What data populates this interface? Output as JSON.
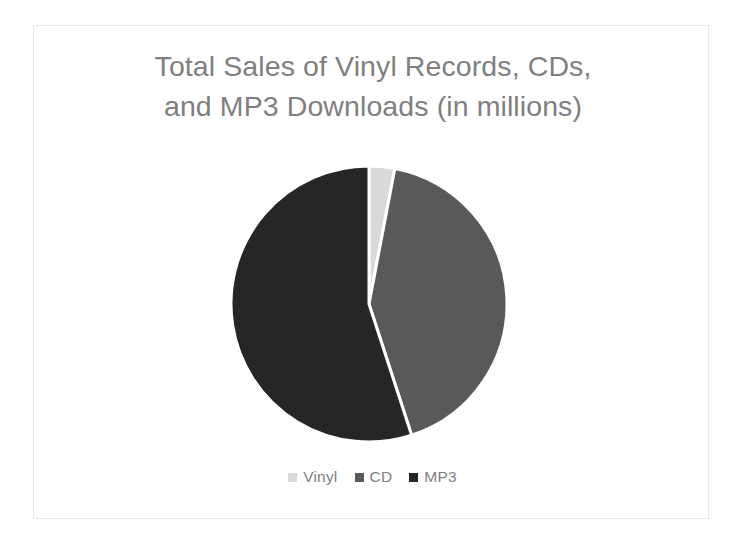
{
  "chart_data": {
    "type": "pie",
    "title": "Total Sales of Vinyl Records, CDs,\nand MP3 Downloads (in millions)",
    "title_line1": "Total Sales of Vinyl Records, CDs,",
    "title_line2": "and MP3 Downloads (in millions)",
    "xlabel": "",
    "ylabel": "",
    "grid": false,
    "legend_position": "bottom",
    "start_angle_deg": 0,
    "direction": "clockwise",
    "units": "millions",
    "categories": [
      "Vinyl",
      "CD",
      "MP3"
    ],
    "values": [
      3,
      42,
      55
    ],
    "percentages": [
      3,
      42,
      55
    ],
    "colors": [
      "#d9d9d9",
      "#595959",
      "#262626"
    ],
    "slices": [
      {
        "label": "Vinyl",
        "value": 3,
        "percent": 3,
        "color": "#d9d9d9",
        "start_deg": 0,
        "end_deg": 10.8
      },
      {
        "label": "CD",
        "value": 42,
        "percent": 42,
        "color": "#595959",
        "start_deg": 10.8,
        "end_deg": 162
      },
      {
        "label": "MP3",
        "value": 55,
        "percent": 55,
        "color": "#262626",
        "start_deg": 162,
        "end_deg": 360
      }
    ],
    "legend": [
      {
        "label": "Vinyl",
        "color": "#d9d9d9"
      },
      {
        "label": "CD",
        "color": "#595959"
      },
      {
        "label": "MP3",
        "color": "#262626"
      }
    ]
  },
  "style": {
    "title_color": "#7f7f7f",
    "legend_text_color": "#7f7f7f",
    "background": "#ffffff",
    "frame_border": "#e8e8e8",
    "slice_gap_color": "#ffffff"
  }
}
